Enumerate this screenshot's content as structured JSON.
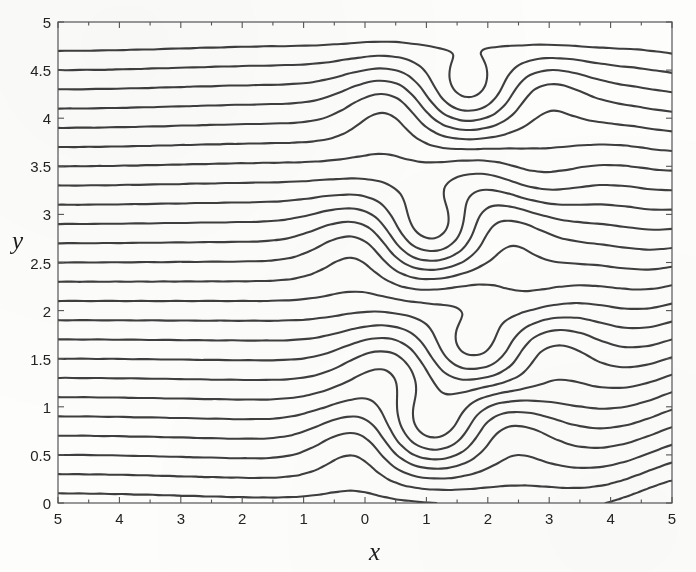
{
  "figure": {
    "background_color": "#fdfdfc",
    "line_color": "#2e2e2e",
    "axis_color": "#555555",
    "width": 696,
    "height": 572
  },
  "axes": {
    "x_title": "x",
    "y_title": "y",
    "plot_left": 58,
    "plot_right": 672,
    "plot_top": 22,
    "plot_bottom": 503
  },
  "chart_data": {
    "type": "line",
    "title": "",
    "subtitle": "",
    "xlabel": "x",
    "ylabel": "y",
    "grid": false,
    "legend": null,
    "annotations": [],
    "xlim": [
      -5,
      5
    ],
    "ylim": [
      0,
      5
    ],
    "x_ticks": [
      -5,
      -4,
      -3,
      -2,
      -1,
      0,
      1,
      2,
      3,
      4,
      5
    ],
    "x_tick_labels": [
      "5",
      "4",
      "3",
      "2",
      "1",
      "0",
      "1",
      "2",
      "3",
      "4",
      "5"
    ],
    "y_ticks": [
      0,
      0.5,
      1,
      1.5,
      2,
      2.5,
      3,
      3.5,
      4,
      4.5,
      5
    ],
    "y_tick_labels": [
      "0",
      "0.5",
      "1",
      "1.5",
      "2",
      "2.5",
      "3",
      "3.5",
      "4",
      "4.5",
      "5"
    ],
    "x_minor_ticks": [
      -4.5,
      -3.5,
      -2.5,
      -1.5,
      -0.5,
      0.5,
      1.5,
      2.5,
      3.5,
      4.5
    ],
    "n_contour_levels": 24,
    "contour_levels": [
      0.1,
      0.3,
      0.5,
      0.7,
      0.9,
      1.1,
      1.3,
      1.5,
      1.7,
      1.9,
      2.1,
      2.3,
      2.5,
      2.7,
      2.9,
      3.1,
      3.3,
      3.5,
      3.7,
      3.9,
      4.1,
      4.3,
      4.5,
      4.7
    ],
    "field": {
      "name": "stream-function",
      "base_slope": 1.0,
      "billow_centers_y": [
        0.65,
        1.45,
        2.7,
        4.15
      ],
      "billow_center_x": 0.55,
      "wave_region_x_start": 1.8,
      "wave_amplitude": 0.16,
      "wave_number": 1.25
    }
  }
}
